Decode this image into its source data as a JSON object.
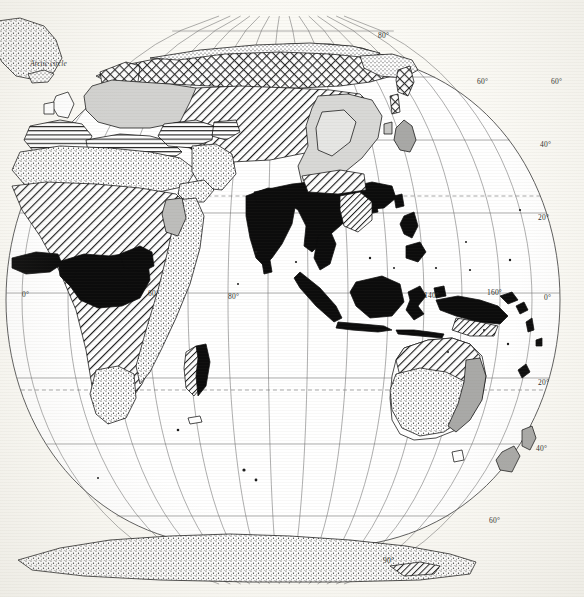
{
  "map": {
    "title": "World distribution map",
    "projection": "oval / pseudocylindrical",
    "annotations": [
      {
        "id": "arctic-circle",
        "text": "Arctic circle",
        "x": 30,
        "y": 59,
        "style": "italic"
      }
    ],
    "graticule": {
      "longitude_labels": [
        {
          "text": "0°",
          "x": 22,
          "y": 290
        },
        {
          "text": "60°",
          "x": 148,
          "y": 289
        },
        {
          "text": "80°",
          "x": 228,
          "y": 292
        },
        {
          "text": "140°",
          "x": 424,
          "y": 291
        },
        {
          "text": "160°",
          "x": 487,
          "y": 288
        }
      ],
      "latitude_labels": [
        {
          "text": "80°",
          "x": 378,
          "y": 31
        },
        {
          "text": "60°",
          "x": 477,
          "y": 77
        },
        {
          "text": "60°",
          "x": 551,
          "y": 77
        },
        {
          "text": "40°",
          "x": 540,
          "y": 140
        },
        {
          "text": "20°",
          "x": 538,
          "y": 213
        },
        {
          "text": "0°",
          "x": 544,
          "y": 293
        },
        {
          "text": "20°",
          "x": 538,
          "y": 378
        },
        {
          "text": "40°",
          "x": 536,
          "y": 444
        },
        {
          "text": "60°",
          "x": 489,
          "y": 516
        },
        {
          "text": "90°",
          "x": 383,
          "y": 556
        }
      ],
      "tropic_lines_dashed": [
        "Tropic of Cancer",
        "Tropic of Capricorn",
        "Arctic circle",
        "Antarctic circle"
      ]
    },
    "legend_patterns": [
      {
        "key": "solid-black",
        "label": "dense / primary distribution"
      },
      {
        "key": "diagonal-hatch",
        "label": "diagonal hatch zone"
      },
      {
        "key": "stipple",
        "label": "stippled / sparse zone"
      },
      {
        "key": "crosshatch",
        "label": "cross-hatched northern zone"
      },
      {
        "key": "horizontal-hatch",
        "label": "horizontally hatched zone"
      },
      {
        "key": "light-gray",
        "label": "light grey fill"
      },
      {
        "key": "mid-gray",
        "label": "mid grey fill"
      }
    ],
    "regions": [
      {
        "name": "greenland",
        "pattern": "stipple"
      },
      {
        "name": "northern-eurasia",
        "pattern": "crosshatch"
      },
      {
        "name": "europe",
        "pattern": "light-gray"
      },
      {
        "name": "central-asia",
        "pattern": "diagonal-hatch"
      },
      {
        "name": "mediterranean-north-africa",
        "pattern": "horizontal-hatch"
      },
      {
        "name": "sahara-arabia",
        "pattern": "stipple"
      },
      {
        "name": "sub-saharan-africa",
        "pattern": "diagonal-hatch"
      },
      {
        "name": "congo-basin",
        "pattern": "solid-black"
      },
      {
        "name": "west-africa-coast",
        "pattern": "solid-black"
      },
      {
        "name": "east-africa",
        "pattern": "stipple"
      },
      {
        "name": "madagascar-east",
        "pattern": "solid-black"
      },
      {
        "name": "madagascar-west",
        "pattern": "diagonal-hatch"
      },
      {
        "name": "india-southeast-asia",
        "pattern": "solid-black"
      },
      {
        "name": "indonesia",
        "pattern": "solid-black"
      },
      {
        "name": "new-guinea",
        "pattern": "solid-black"
      },
      {
        "name": "china",
        "pattern": "light-gray"
      },
      {
        "name": "japan",
        "pattern": "mid-gray"
      },
      {
        "name": "northern-australia",
        "pattern": "diagonal-hatch"
      },
      {
        "name": "central-australia",
        "pattern": "stipple"
      },
      {
        "name": "eastern-australia-coast",
        "pattern": "mid-gray"
      },
      {
        "name": "new-zealand",
        "pattern": "mid-gray"
      },
      {
        "name": "antarctica",
        "pattern": "stipple"
      }
    ]
  }
}
